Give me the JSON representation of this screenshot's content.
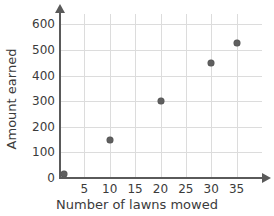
{
  "clipped_title": "",
  "chart_data": {
    "type": "scatter",
    "title": "",
    "xlabel": "Number of lawns mowed",
    "ylabel": "Amount earned",
    "xlim": [
      0,
      40
    ],
    "ylim": [
      0,
      640
    ],
    "grid": true,
    "legend": "none",
    "x_ticks": [
      5,
      10,
      15,
      20,
      25,
      30,
      35
    ],
    "x_tick_labels": [
      "5",
      "10",
      "15",
      "20",
      "25",
      "30",
      "35"
    ],
    "y_ticks": [
      0,
      100,
      200,
      300,
      400,
      500,
      600
    ],
    "y_tick_labels": [
      "0",
      "100",
      "200",
      "300",
      "400",
      "500",
      "600"
    ],
    "points": [
      {
        "x": 1,
        "y": 15
      },
      {
        "x": 10,
        "y": 150
      },
      {
        "x": 20,
        "y": 300
      },
      {
        "x": 30,
        "y": 450
      },
      {
        "x": 35,
        "y": 525
      }
    ],
    "marker_color": "#5f5f5f",
    "grid_color": "#dcdcdc",
    "axis_color": "#5a5a5a",
    "background_color": "#ffffff"
  }
}
